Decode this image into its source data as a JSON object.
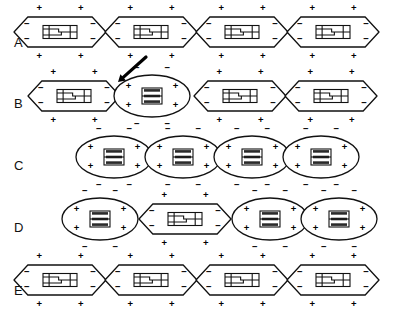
{
  "figure": {
    "width": 397,
    "height": 315,
    "background_color": "#ffffff",
    "line_color": "#111111"
  },
  "legend_symbols": {
    "positive": "+",
    "negative": "−",
    "positive_name": "plus-charge",
    "negative_name": "minus-charge"
  },
  "rows": [
    {
      "label": "A",
      "label_y": 47,
      "description": "All four cells polarized and relaxed (elongated lens shape, plus charges outside, minus charges inside)",
      "baseline_y": 32,
      "start_x": 14,
      "cells": [
        {
          "state": "relaxed",
          "shape": "lens",
          "outer_sign": "+",
          "inner_sign": "−",
          "cx": 60,
          "rx": 46,
          "ry": 15
        },
        {
          "state": "relaxed",
          "shape": "lens",
          "outer_sign": "+",
          "inner_sign": "−",
          "cx": 151,
          "rx": 46,
          "ry": 15
        },
        {
          "state": "relaxed",
          "shape": "lens",
          "outer_sign": "+",
          "inner_sign": "−",
          "cx": 242,
          "rx": 46,
          "ry": 15
        },
        {
          "state": "relaxed",
          "shape": "lens",
          "outer_sign": "+",
          "inner_sign": "−",
          "cx": 333,
          "rx": 46,
          "ry": 15
        }
      ]
    },
    {
      "label": "B",
      "label_y": 108,
      "description": "Second cell depolarized and contracting (round shape, minus charges outside, plus charges inside); arrow indicates the stimulated cell",
      "baseline_y": 96,
      "start_x": 28,
      "cells": [
        {
          "state": "relaxed",
          "shape": "lens",
          "outer_sign": "+",
          "inner_sign": "−",
          "cx": 74,
          "rx": 46,
          "ry": 15
        },
        {
          "state": "contracted",
          "shape": "round",
          "outer_sign": "−",
          "inner_sign": "+",
          "cx": 152,
          "rx": 38,
          "ry": 21
        },
        {
          "state": "relaxed",
          "shape": "lens",
          "outer_sign": "+",
          "inner_sign": "−",
          "cx": 240,
          "rx": 46,
          "ry": 15
        },
        {
          "state": "relaxed",
          "shape": "lens",
          "outer_sign": "+",
          "inner_sign": "−",
          "cx": 331,
          "rx": 46,
          "ry": 15
        }
      ]
    },
    {
      "label": "C",
      "label_y": 170,
      "description": "All four cells depolarized and fully contracted; chain is shortest",
      "baseline_y": 157,
      "start_x": 76,
      "cells": [
        {
          "state": "contracted",
          "shape": "round",
          "outer_sign": "−",
          "inner_sign": "+",
          "cx": 114,
          "rx": 38,
          "ry": 21
        },
        {
          "state": "contracted",
          "shape": "round",
          "outer_sign": "−",
          "inner_sign": "+",
          "cx": 183,
          "rx": 38,
          "ry": 21
        },
        {
          "state": "contracted",
          "shape": "round",
          "outer_sign": "−",
          "inner_sign": "+",
          "cx": 252,
          "rx": 38,
          "ry": 21
        },
        {
          "state": "contracted",
          "shape": "round",
          "outer_sign": "−",
          "inner_sign": "+",
          "cx": 321,
          "rx": 38,
          "ry": 21
        }
      ]
    },
    {
      "label": "D",
      "label_y": 232,
      "description": "Second cell has repolarized and relaxed while the others remain contracted",
      "baseline_y": 219,
      "start_x": 62,
      "cells": [
        {
          "state": "contracted",
          "shape": "round",
          "outer_sign": "−",
          "inner_sign": "+",
          "cx": 100,
          "rx": 38,
          "ry": 21
        },
        {
          "state": "relaxed",
          "shape": "lens",
          "outer_sign": "+",
          "inner_sign": "−",
          "cx": 185,
          "rx": 46,
          "ry": 15
        },
        {
          "state": "contracted",
          "shape": "round",
          "outer_sign": "−",
          "inner_sign": "+",
          "cx": 270,
          "rx": 38,
          "ry": 21
        },
        {
          "state": "contracted",
          "shape": "round",
          "outer_sign": "−",
          "inner_sign": "+",
          "cx": 339,
          "rx": 38,
          "ry": 21
        }
      ]
    },
    {
      "label": "E",
      "label_y": 295,
      "description": "All four cells repolarized and relaxed again, returning to the resting state of row A",
      "baseline_y": 280,
      "start_x": 14,
      "cells": [
        {
          "state": "relaxed",
          "shape": "lens",
          "outer_sign": "+",
          "inner_sign": "−",
          "cx": 60,
          "rx": 46,
          "ry": 15
        },
        {
          "state": "relaxed",
          "shape": "lens",
          "outer_sign": "+",
          "inner_sign": "−",
          "cx": 151,
          "rx": 46,
          "ry": 15
        },
        {
          "state": "relaxed",
          "shape": "lens",
          "outer_sign": "+",
          "inner_sign": "−",
          "cx": 242,
          "rx": 46,
          "ry": 15
        },
        {
          "state": "relaxed",
          "shape": "lens",
          "outer_sign": "+",
          "inner_sign": "−",
          "cx": 333,
          "rx": 46,
          "ry": 15
        }
      ]
    }
  ],
  "annotations": [
    {
      "name": "stimulus-arrow",
      "type": "arrow",
      "points_to_row": "B",
      "points_to_cell_index": 1,
      "x1": 146,
      "y1": 57,
      "x2": 118,
      "y2": 82
    }
  ]
}
